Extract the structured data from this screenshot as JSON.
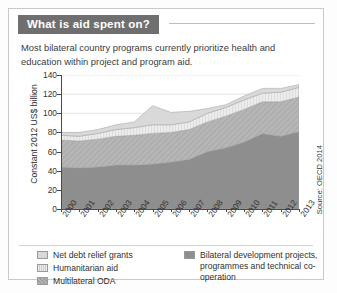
{
  "card": {
    "title": "What is aid spent on?",
    "subtitle": "Most bilateral country programs currently prioritize health and education within project and program aid.",
    "source": "Source: OECD 2014"
  },
  "legend": {
    "items": [
      {
        "label": "Net debt relief grants",
        "color": "#d9d9d9",
        "pattern": "solid"
      },
      {
        "label": "Humanitarian aid",
        "color": "#e8e8e8",
        "pattern": "vertical-stripes"
      },
      {
        "label": "Multilateral ODA",
        "color": "#b6b6b6",
        "pattern": "diagonal-hatch"
      },
      {
        "label": "Bilateral development projects, programmes and technical co-operation",
        "color": "#8e8e8e",
        "pattern": "solid"
      }
    ]
  },
  "chart_data": {
    "type": "area",
    "stacked": true,
    "title": "What is aid spent on?",
    "xlabel": "",
    "ylabel": "Constant 2012 US$ billion",
    "ylim": [
      0,
      140
    ],
    "yticks": [
      0,
      20,
      40,
      60,
      80,
      100,
      120,
      140
    ],
    "grid": true,
    "legend_position": "bottom",
    "categories": [
      "2000",
      "2001",
      "2002",
      "2003",
      "2004",
      "2005",
      "2006",
      "2007",
      "2008",
      "2009",
      "2010",
      "2011",
      "2012",
      "2013"
    ],
    "series": [
      {
        "name": "Bilateral development projects, programmes and technical co-operation",
        "color": "#8e8e8e",
        "values": [
          44,
          43,
          44,
          46,
          46,
          47,
          49,
          52,
          60,
          64,
          70,
          79,
          76,
          81
        ]
      },
      {
        "name": "Multilateral ODA",
        "color": "#b6b6b6",
        "values": [
          28,
          28,
          29,
          30,
          31,
          32,
          31,
          31,
          31,
          33,
          34,
          33,
          36,
          36
        ]
      },
      {
        "name": "Humanitarian aid",
        "color": "#e8e8e8",
        "values": [
          5,
          5,
          6,
          7,
          8,
          9,
          8,
          8,
          9,
          9,
          10,
          9,
          10,
          10
        ]
      },
      {
        "name": "Net debt relief grants",
        "color": "#d9d9d9",
        "values": [
          3,
          4,
          4,
          5,
          6,
          20,
          13,
          11,
          5,
          3,
          4,
          5,
          4,
          3
        ]
      }
    ],
    "totals": [
      80,
      80,
      83,
      88,
      91,
      108,
      101,
      102,
      105,
      109,
      118,
      126,
      126,
      130
    ]
  }
}
